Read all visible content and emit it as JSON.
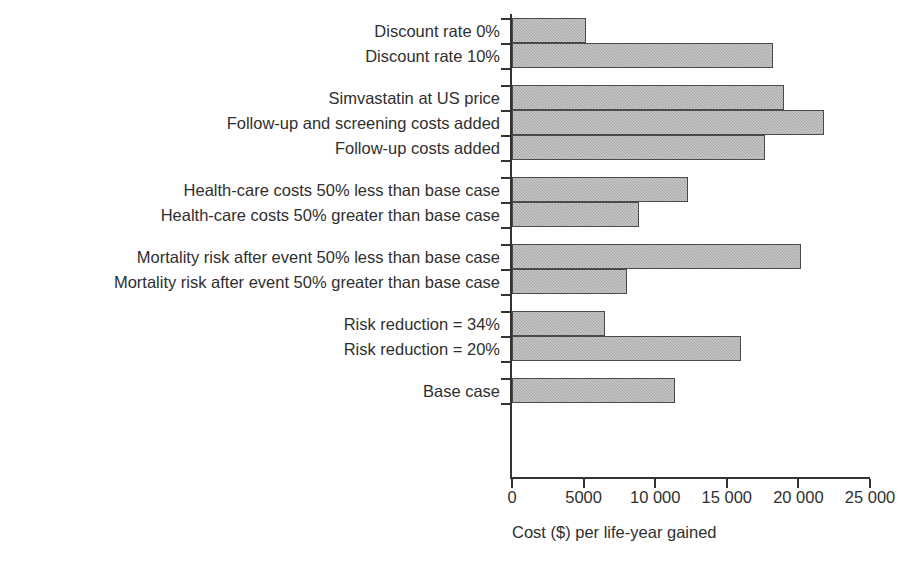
{
  "chart_data": {
    "type": "bar",
    "orientation": "horizontal",
    "title": "",
    "xlabel": "Cost ($) per life-year gained",
    "ylabel": "",
    "xlim": [
      0,
      25000
    ],
    "xticks": [
      0,
      5000,
      10000,
      15000,
      20000,
      25000
    ],
    "xtick_labels": [
      "0",
      "5000",
      "10 000",
      "15 000",
      "20 000",
      "25 000"
    ],
    "grid": false,
    "legend": false,
    "bar_color": "#a6a6a6",
    "bar_edge_color": "#4a4a4a",
    "axis_color": "#333333",
    "categories": [
      "Discount rate 0%",
      "Discount rate 10%",
      "Simvastatin at US price",
      "Follow-up and screening costs added",
      "Follow-up costs added",
      "Health-care costs 50% less than base case",
      "Health-care costs 50% greater than base case",
      "Mortality risk after event 50% less than base case",
      "Mortality risk after event 50% greater than base case",
      "Risk reduction = 34%",
      "Risk reduction = 20%",
      "Base case"
    ],
    "values": [
      5200,
      18200,
      19000,
      21800,
      17700,
      12300,
      8900,
      20200,
      8000,
      6500,
      16000,
      11400
    ],
    "groups": [
      {
        "name": "discount-rate",
        "category_indices": [
          0,
          1
        ]
      },
      {
        "name": "cost-inclusions",
        "category_indices": [
          2,
          3,
          4
        ]
      },
      {
        "name": "health-care-costs",
        "category_indices": [
          5,
          6
        ]
      },
      {
        "name": "mortality-risk",
        "category_indices": [
          7,
          8
        ]
      },
      {
        "name": "risk-reduction",
        "category_indices": [
          9,
          10
        ]
      },
      {
        "name": "base-case",
        "category_indices": [
          11
        ]
      }
    ]
  }
}
